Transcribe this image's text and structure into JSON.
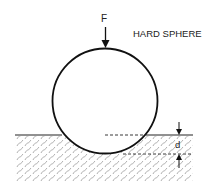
{
  "diagram": {
    "title_label": "HARD SPHERE",
    "force_label": "F",
    "depth_label": "d",
    "colors": {
      "stroke": "#222222",
      "hatch": "#9a9a9a",
      "background": "#ffffff"
    }
  }
}
